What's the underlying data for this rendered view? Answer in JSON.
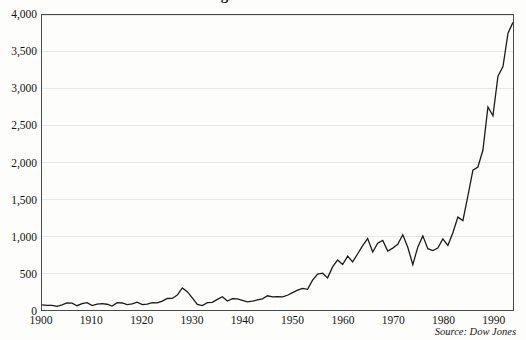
{
  "figure": {
    "title_partial": "Dow Jones Industrial Average",
    "source_note": "Source: Dow Jones"
  },
  "chart_data": {
    "type": "line",
    "title": "Dow Jones Industrial Average",
    "subtitle": "",
    "xlabel": "",
    "ylabel": "",
    "xlim": [
      1900,
      1994
    ],
    "ylim": [
      0,
      4000
    ],
    "grid": true,
    "legend": null,
    "annotations": [],
    "line_color": "#1a1a1a",
    "background_color": "#fdfdfb",
    "gridline_color": "#e8e8e6",
    "frame_color": "#4a4a4a",
    "xticks": [
      1900,
      1910,
      1920,
      1930,
      1940,
      1950,
      1960,
      1970,
      1980,
      1990
    ],
    "xtick_labels": [
      "1900",
      "1910",
      "1920",
      "1930",
      "1940",
      "1950",
      "1960",
      "1970",
      "1980",
      "1990"
    ],
    "yticks": [
      0,
      500,
      1000,
      1500,
      2000,
      2500,
      3000,
      3500,
      4000
    ],
    "ytick_labels": [
      "0",
      "500",
      "1,000",
      "1,500",
      "2,000",
      "2,500",
      "3,000",
      "3,500",
      "4,000"
    ],
    "series": [
      {
        "name": "Dow Jones Industrial Average",
        "x": [
          1900,
          1901,
          1902,
          1903,
          1904,
          1905,
          1906,
          1907,
          1908,
          1909,
          1910,
          1911,
          1912,
          1913,
          1914,
          1915,
          1916,
          1917,
          1918,
          1919,
          1920,
          1921,
          1922,
          1923,
          1924,
          1925,
          1926,
          1927,
          1928,
          1929,
          1930,
          1931,
          1932,
          1933,
          1934,
          1935,
          1936,
          1937,
          1938,
          1939,
          1940,
          1941,
          1942,
          1943,
          1944,
          1945,
          1946,
          1947,
          1948,
          1949,
          1950,
          1951,
          1952,
          1953,
          1954,
          1955,
          1956,
          1957,
          1958,
          1959,
          1960,
          1961,
          1962,
          1963,
          1964,
          1965,
          1966,
          1967,
          1968,
          1969,
          1970,
          1971,
          1972,
          1973,
          1974,
          1975,
          1976,
          1977,
          1978,
          1979,
          1980,
          1981,
          1982,
          1983,
          1984,
          1985,
          1986,
          1987,
          1988,
          1989,
          1990,
          1991,
          1992,
          1993,
          1994
        ],
        "values": [
          70,
          64,
          64,
          49,
          69,
          96,
          94,
          58,
          86,
          99,
          59,
          81,
          87,
          78,
          54,
          99,
          95,
          74,
          82,
          107,
          72,
          81,
          99,
          96,
          120,
          156,
          157,
          202,
          300,
          248,
          164,
          77,
          60,
          99,
          104,
          144,
          180,
          121,
          155,
          150,
          131,
          111,
          119,
          136,
          152,
          193,
          177,
          181,
          177,
          200,
          235,
          269,
          292,
          281,
          404,
          488,
          499,
          436,
          584,
          679,
          616,
          731,
          652,
          763,
          874,
          969,
          786,
          905,
          944,
          800,
          839,
          890,
          1020,
          851,
          616,
          852,
          1005,
          831,
          805,
          839,
          964,
          875,
          1047,
          1259,
          1212,
          1547,
          1896,
          1939,
          2169,
          2753,
          2634,
          3169,
          3301,
          3754,
          3900
        ],
        "style": "solid",
        "linewidth": 1.3
      }
    ]
  }
}
